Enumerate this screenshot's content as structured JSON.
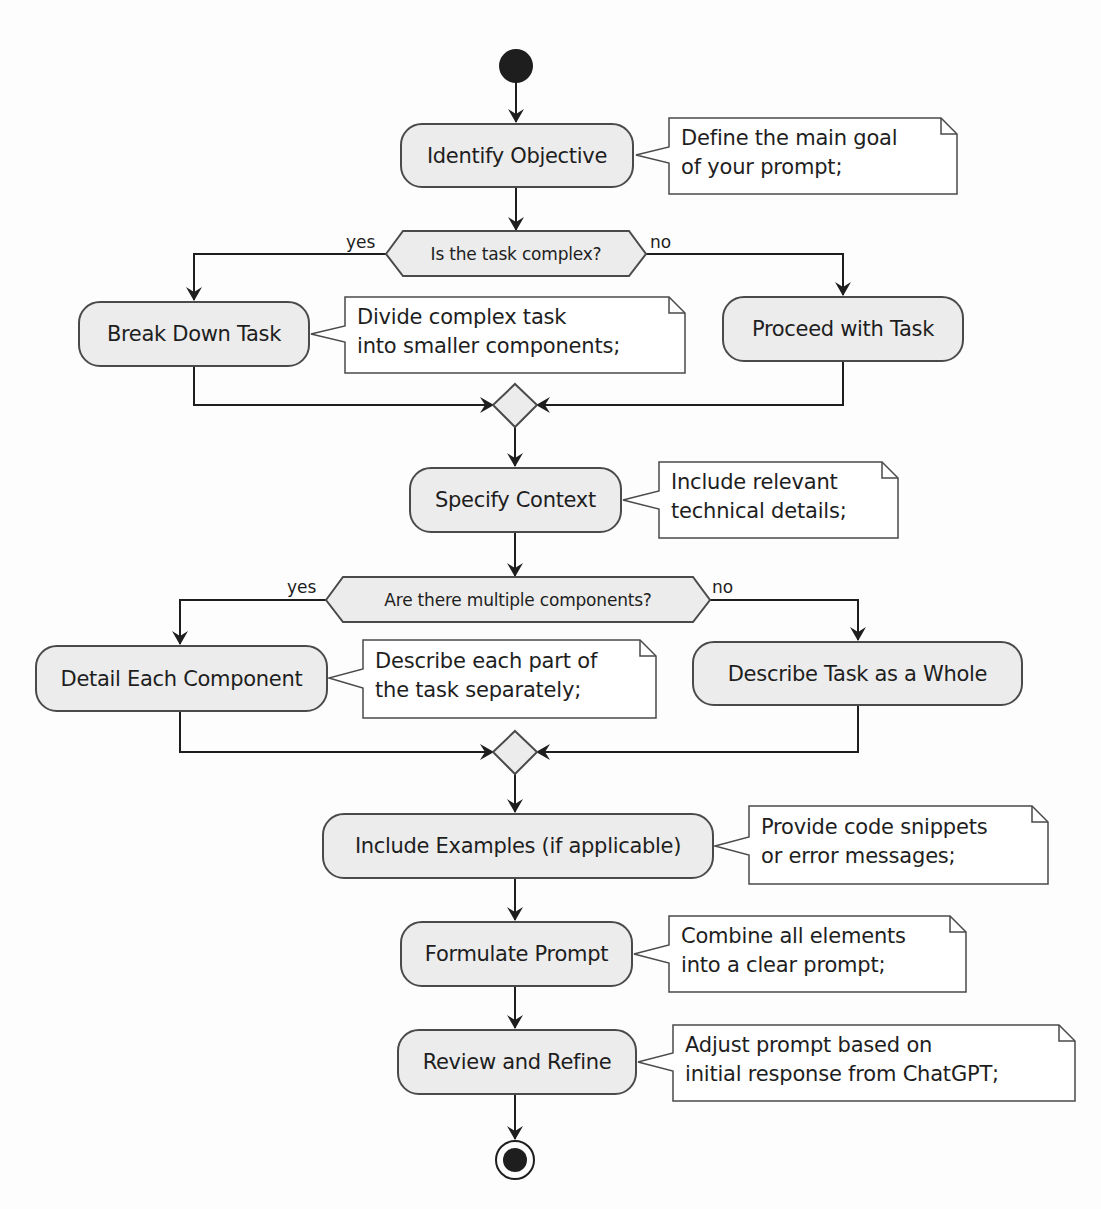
{
  "diagram": {
    "type": "activity-diagram",
    "colors": {
      "background": "#fdfdfd",
      "activity_fill": "#ececec",
      "stroke": "#4a4a4a",
      "text": "#1e1e1e",
      "note_fill": "#ffffff",
      "node_fill": "#1e1e1e"
    },
    "start_node": "start",
    "end_node": "end",
    "activities": [
      {
        "id": "identify",
        "label": "Identify Objective",
        "note": [
          "Define the main goal",
          "of your prompt;"
        ]
      },
      {
        "id": "break_down",
        "label": "Break Down Task",
        "note": [
          "Divide complex task",
          "into smaller components;"
        ]
      },
      {
        "id": "proceed",
        "label": "Proceed with Task"
      },
      {
        "id": "context",
        "label": "Specify Context",
        "note": [
          "Include relevant",
          "technical details;"
        ]
      },
      {
        "id": "detail",
        "label": "Detail Each Component",
        "note": [
          "Describe each part of",
          "the task separately;"
        ]
      },
      {
        "id": "whole",
        "label": "Describe Task as a Whole"
      },
      {
        "id": "examples",
        "label": "Include Examples (if applicable)",
        "note": [
          "Provide code snippets",
          "or error messages;"
        ]
      },
      {
        "id": "formulate",
        "label": "Formulate Prompt",
        "note": [
          "Combine all elements",
          "into a clear prompt;"
        ]
      },
      {
        "id": "review",
        "label": "Review and Refine",
        "note": [
          "Adjust prompt based on",
          "initial response from ChatGPT;"
        ]
      }
    ],
    "decisions": [
      {
        "id": "complex",
        "question": "Is the task complex?",
        "yes_label": "yes",
        "no_label": "no",
        "yes_target": "break_down",
        "no_target": "proceed"
      },
      {
        "id": "multiple",
        "question": "Are there multiple components?",
        "yes_label": "yes",
        "no_label": "no",
        "yes_target": "detail",
        "no_target": "whole"
      }
    ]
  }
}
